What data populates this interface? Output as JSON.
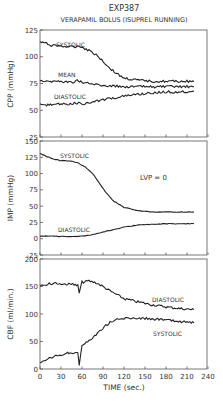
{
  "title": "EXP387",
  "subtitle": "VERAPAMIL BOLUS (ISUPREL RUNNING)",
  "colors": {
    "line": "#222222",
    "frame": "#555555",
    "text": "#333333"
  },
  "chart_data": [
    {
      "type": "line",
      "title": "EXP387 — VERAPAMIL BOLUS (ISUPREL RUNNING)",
      "xlabel": "TIME (sec.)",
      "ylabel": "CPP (mmHg)",
      "xlim": [
        0,
        240
      ],
      "ylim": [
        25,
        125
      ],
      "yticks": [
        25,
        50,
        75,
        100,
        125
      ],
      "grid": false,
      "series": [
        {
          "name": "SYSTOLIC",
          "x": [
            0,
            15,
            30,
            45,
            55,
            60,
            70,
            80,
            90,
            100,
            110,
            120,
            140,
            160,
            180,
            200,
            220
          ],
          "values": [
            114,
            111,
            110,
            109,
            110,
            109,
            106,
            102,
            96,
            89,
            84,
            80,
            78,
            77,
            77,
            77,
            77
          ]
        },
        {
          "name": "MEAN",
          "x": [
            0,
            15,
            30,
            45,
            55,
            60,
            70,
            80,
            90,
            100,
            120,
            140,
            160,
            180,
            200,
            220
          ],
          "values": [
            78,
            77,
            77,
            76,
            78,
            76,
            75,
            74,
            73,
            73,
            72,
            72,
            72,
            72,
            72,
            72
          ]
        },
        {
          "name": "DIASTOLIC",
          "x": [
            0,
            15,
            30,
            45,
            55,
            60,
            70,
            80,
            90,
            100,
            120,
            140,
            160,
            180,
            200,
            220
          ],
          "values": [
            55,
            55,
            56,
            56,
            57,
            56,
            57,
            58,
            60,
            61,
            63,
            65,
            66,
            67,
            67,
            68
          ]
        }
      ]
    },
    {
      "type": "line",
      "xlabel": "TIME (sec.)",
      "ylabel": "IMP (mmHg)",
      "xlim": [
        0,
        240
      ],
      "ylim": [
        -25,
        150
      ],
      "yticks": [
        -25,
        0,
        25,
        50,
        75,
        100,
        125,
        150
      ],
      "annotation": "LVP = 0",
      "series": [
        {
          "name": "SYSTOLIC",
          "x": [
            0,
            10,
            20,
            30,
            45,
            55,
            65,
            75,
            85,
            95,
            105,
            120,
            140,
            160,
            180,
            200,
            220
          ],
          "values": [
            131,
            126,
            122,
            120,
            119,
            116,
            110,
            100,
            85,
            70,
            58,
            48,
            43,
            41,
            41,
            41,
            41
          ]
        },
        {
          "name": "DIASTOLIC",
          "x": [
            0,
            20,
            40,
            60,
            75,
            90,
            105,
            120,
            140,
            160,
            180,
            200,
            220
          ],
          "values": [
            4,
            4,
            3,
            4,
            6,
            10,
            14,
            18,
            21,
            22,
            23,
            23,
            23
          ]
        }
      ]
    },
    {
      "type": "line",
      "xlabel": "TIME (sec.)",
      "ylabel": "CBF (ml/min.)",
      "xlim": [
        0,
        240
      ],
      "ylim": [
        0,
        200
      ],
      "yticks": [
        0,
        50,
        100,
        150,
        200
      ],
      "xticks": [
        0,
        30,
        60,
        90,
        120,
        150,
        180,
        210,
        240
      ],
      "series": [
        {
          "name": "DIASTOLIC",
          "x": [
            0,
            15,
            30,
            45,
            54,
            56,
            60,
            70,
            80,
            90,
            100,
            110,
            120,
            140,
            160,
            180,
            200,
            220
          ],
          "values": [
            152,
            155,
            155,
            154,
            152,
            138,
            158,
            160,
            157,
            150,
            142,
            135,
            128,
            122,
            117,
            113,
            110,
            108
          ]
        },
        {
          "name": "SYSTOLIC",
          "x": [
            0,
            15,
            30,
            45,
            54,
            56,
            60,
            70,
            80,
            90,
            100,
            110,
            120,
            140,
            160,
            180,
            200,
            220
          ],
          "values": [
            10,
            20,
            26,
            30,
            30,
            8,
            42,
            52,
            62,
            75,
            85,
            90,
            92,
            93,
            91,
            89,
            86,
            84
          ]
        }
      ]
    }
  ],
  "labels": {
    "p1": {
      "systolic": "SYSTOLIC",
      "mean": "MEAN",
      "diastolic": "DIASTOLIC"
    },
    "p2": {
      "systolic": "SYSTOLIC",
      "diastolic": "DIASTOLIC",
      "annotation": "LVP = 0"
    },
    "p3": {
      "diastolic": "DIASTOLIC",
      "systolic": "SYSTOLIC"
    },
    "ylabel1": "CPP (mmHg)",
    "ylabel2": "IMP (mmHg)",
    "ylabel3": "CBF (ml/min.)",
    "xlabel": "TIME (sec.)"
  },
  "ticks": {
    "p1": [
      "125",
      "100",
      "75",
      "50",
      "25"
    ],
    "p2": [
      "150",
      "125",
      "100",
      "75",
      "50",
      "25",
      "0",
      "-25"
    ],
    "p3": [
      "200",
      "150",
      "100",
      "50",
      "0"
    ],
    "x": [
      "0",
      "30",
      "60",
      "90",
      "120",
      "150",
      "180",
      "210",
      "240"
    ]
  }
}
